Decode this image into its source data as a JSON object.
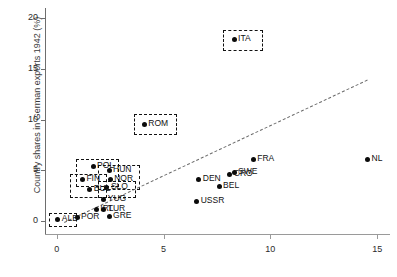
{
  "chart_data": {
    "type": "scatter",
    "title": "",
    "xlabel": "",
    "ylabel": "Country shares in German exports 1942 (%)",
    "xlim": [
      -0.55,
      15.6
    ],
    "ylim": [
      -0.9,
      21.0
    ],
    "xticks": [
      "0",
      "5",
      "10",
      "15"
    ],
    "xtick_values": [
      0,
      5,
      10,
      15
    ],
    "yticks": [
      "0",
      "5",
      "10",
      "15",
      "20"
    ],
    "ytick_values": [
      0,
      5,
      10,
      15,
      20
    ],
    "grid": false,
    "legend": "none",
    "points": [
      {
        "label": "ALB",
        "x": 0.05,
        "y": 0.1,
        "lab_dx": 4,
        "lab_dy": -3.5,
        "highlight": true
      },
      {
        "label": "POR",
        "x": 0.95,
        "y": 0.35,
        "lab_dx": 4,
        "lab_dy": -3.5,
        "highlight": false
      },
      {
        "label": "GRE",
        "x": 2.45,
        "y": 0.45,
        "lab_dx": 4,
        "lab_dy": -3.5,
        "highlight": false
      },
      {
        "label": "IRL",
        "x": 1.85,
        "y": 1.15,
        "lab_dx": 4,
        "lab_dy": -3.5,
        "highlight": false
      },
      {
        "label": "TUR",
        "x": 2.2,
        "y": 1.1,
        "lab_dx": 4,
        "lab_dy": -3.5,
        "highlight": false
      },
      {
        "label": "YUG",
        "x": 2.2,
        "y": 2.15,
        "lab_dx": 4,
        "lab_dy": -3.5,
        "highlight": false
      },
      {
        "label": "BUL",
        "x": 1.55,
        "y": 3.1,
        "lab_dx": 4,
        "lab_dy": -3.5,
        "highlight": true
      },
      {
        "label": "SLO",
        "x": 2.35,
        "y": 3.3,
        "lab_dx": 4,
        "lab_dy": -3.5,
        "highlight": true
      },
      {
        "label": "FIN",
        "x": 1.2,
        "y": 4.05,
        "lab_dx": 4,
        "lab_dy": -3.5,
        "highlight": true
      },
      {
        "label": "NOR",
        "x": 2.5,
        "y": 4.1,
        "lab_dx": 4,
        "lab_dy": -3.5,
        "highlight": true
      },
      {
        "label": "POL",
        "x": 1.7,
        "y": 5.35,
        "lab_dx": 4,
        "lab_dy": -3.5,
        "highlight": true
      },
      {
        "label": "HUN",
        "x": 2.45,
        "y": 4.95,
        "lab_dx": 4,
        "lab_dy": -3.5,
        "highlight": true
      },
      {
        "label": "ROM",
        "x": 4.1,
        "y": 9.55,
        "lab_dx": 4,
        "lab_dy": -3.5,
        "highlight": true
      },
      {
        "label": "ITA",
        "x": 8.3,
        "y": 17.9,
        "lab_dx": 4,
        "lab_dy": -3.5,
        "highlight": true
      },
      {
        "label": "USSR",
        "x": 6.55,
        "y": 1.95,
        "lab_dx": 4,
        "lab_dy": -3.5,
        "highlight": false
      },
      {
        "label": "DEN",
        "x": 6.65,
        "y": 4.05,
        "lab_dx": 4,
        "lab_dy": -3.5,
        "highlight": false
      },
      {
        "label": "BEL",
        "x": 7.6,
        "y": 3.4,
        "lab_dx": 4,
        "lab_dy": -3.5,
        "highlight": false
      },
      {
        "label": "CRO",
        "x": 8.1,
        "y": 4.55,
        "lab_dx": 4,
        "lab_dy": -3.5,
        "highlight": false
      },
      {
        "label": "SWE",
        "x": 8.3,
        "y": 4.75,
        "lab_dx": 4,
        "lab_dy": -3.5,
        "highlight": false
      },
      {
        "label": "FRA",
        "x": 9.2,
        "y": 6.05,
        "lab_dx": 4,
        "lab_dy": -3.5,
        "highlight": false
      },
      {
        "label": "NL",
        "x": 14.55,
        "y": 6.05,
        "lab_dx": 4,
        "lab_dy": -3.5,
        "highlight": false
      }
    ],
    "trend_line": {
      "style": "dashed",
      "color": "#6b6b6b",
      "x1": 0.35,
      "y1": -0.15,
      "x2": 14.55,
      "y2": 13.9
    },
    "highlight_boxes": [
      {
        "name": "alb-box",
        "x": -0.38,
        "y": -0.42,
        "w": 1.25,
        "h": 1.15
      },
      {
        "name": "pol-box",
        "x": 0.88,
        "y": 3.55,
        "w": 1.92,
        "h": 2.55
      },
      {
        "name": "fin-box",
        "x": 0.6,
        "y": 2.45,
        "w": 1.65,
        "h": 2.15
      },
      {
        "name": "hun-box",
        "x": 1.92,
        "y": 3.25,
        "w": 1.9,
        "h": 2.25
      },
      {
        "name": "slo-box",
        "x": 1.95,
        "y": 2.5,
        "w": 1.65,
        "h": 1.45
      },
      {
        "name": "rom-box",
        "x": 3.6,
        "y": 8.65,
        "w": 1.95,
        "h": 1.85
      },
      {
        "name": "ita-box",
        "x": 7.8,
        "y": 17.0,
        "w": 1.75,
        "h": 1.85
      }
    ]
  }
}
